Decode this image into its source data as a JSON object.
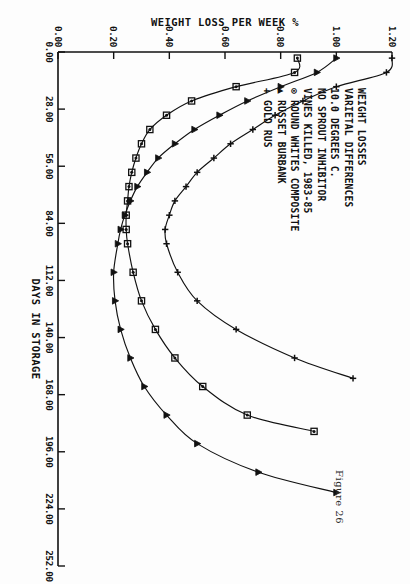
{
  "figure": {
    "caption": "Figure 26"
  },
  "chart_data": {
    "type": "line",
    "title": "WEIGHT LOSSES",
    "subtitle": "VARIETAL DIFFERENCES",
    "annotations": [
      "WEIGHT LOSSES",
      "VARIETAL DIFFERENCES",
      "10.0 DEGREES C.",
      "NO SPROUT INHIBITOR",
      "VINES KILLED, 1983-85"
    ],
    "xlabel": "DAYS IN STORAGE",
    "ylabel": "WEIGHT LOSS PER WEEK %",
    "xlim": [
      0,
      252
    ],
    "ylim": [
      0,
      1.2
    ],
    "xticks": [
      "0.00",
      "28.00",
      "56.00",
      "84.00",
      "112.00",
      "140.00",
      "168.00",
      "196.00",
      "224.00",
      "252.00"
    ],
    "xtick_values": [
      0,
      28,
      56,
      84,
      112,
      140,
      168,
      196,
      224,
      252
    ],
    "yticks": [
      "0.00",
      "0.20",
      "0.40",
      "0.60",
      "0.80",
      "1.00",
      "1.20"
    ],
    "ytick_values": [
      0,
      0.2,
      0.4,
      0.6,
      0.8,
      1.0,
      1.2
    ],
    "grid": false,
    "legend_position": "upper-left-inside",
    "series": [
      {
        "name": "ROUND WHITES COMPOSITE",
        "marker": "circle-dot",
        "legend_glyph": "⊙",
        "legend_label": "ROUND WHITES COMPOSITE",
        "x": [
          3,
          10,
          17,
          24,
          31,
          38,
          45,
          52,
          59,
          66,
          73,
          80,
          87,
          94,
          108,
          122,
          136,
          150,
          164,
          178,
          186
        ],
        "y": [
          0.86,
          0.85,
          0.64,
          0.48,
          0.39,
          0.33,
          0.3,
          0.28,
          0.265,
          0.255,
          0.25,
          0.245,
          0.245,
          0.25,
          0.27,
          0.3,
          0.35,
          0.42,
          0.52,
          0.68,
          0.92
        ]
      },
      {
        "name": "RUSSET BURBANK",
        "marker": "triangle",
        "legend_glyph": "▲",
        "legend_label": "RUSSET BURBANK",
        "x": [
          3,
          10,
          17,
          24,
          31,
          38,
          45,
          52,
          59,
          66,
          73,
          80,
          87,
          94,
          108,
          122,
          136,
          150,
          164,
          178,
          192,
          206,
          216
        ],
        "y": [
          1.0,
          0.93,
          0.8,
          0.68,
          0.58,
          0.49,
          0.42,
          0.36,
          0.32,
          0.285,
          0.26,
          0.24,
          0.225,
          0.215,
          0.2,
          0.205,
          0.225,
          0.26,
          0.31,
          0.39,
          0.5,
          0.72,
          1.0
        ]
      },
      {
        "name": "GOLD RUS",
        "marker": "plus",
        "legend_glyph": "+",
        "legend_label": "GOLD RUS",
        "x": [
          3,
          10,
          17,
          24,
          31,
          38,
          45,
          52,
          59,
          66,
          73,
          80,
          87,
          94,
          108,
          122,
          136,
          150,
          160
        ],
        "y": [
          1.2,
          1.18,
          1.0,
          0.88,
          0.78,
          0.7,
          0.62,
          0.56,
          0.5,
          0.46,
          0.42,
          0.4,
          0.385,
          0.39,
          0.43,
          0.5,
          0.64,
          0.85,
          1.06
        ]
      }
    ],
    "legend_entries": [
      {
        "glyph": "⊙",
        "label": "ROUND WHITES COMPOSITE"
      },
      {
        "glyph": "▲",
        "label": "RUSSET BURBANK"
      },
      {
        "glyph": "+",
        "label": "GOLD RUS"
      }
    ]
  }
}
